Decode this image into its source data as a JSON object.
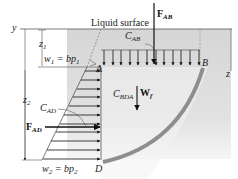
{
  "diagram": {
    "labels": {
      "liquid_surface": "Liquid surface",
      "y_axis": "y",
      "z_axis": "z",
      "z1": "z",
      "z1_sub": "1",
      "z2": "z",
      "z2_sub": "2",
      "w1_lhs": "w",
      "w1_sub": "1",
      "w1_rhs": " = bp",
      "w1_rhs_sub": "1",
      "w2_lhs": "w",
      "w2_sub": "2",
      "w2_rhs": " = bp",
      "w2_rhs_sub": "2",
      "point_A": "A",
      "point_B": "B",
      "point_D": "D",
      "F_AB": "F",
      "F_AB_sub": "AB",
      "C_AB": "C",
      "C_AB_sub": "AB",
      "W_f": "W",
      "W_f_sub": "f",
      "C_BDA": "C",
      "C_BDA_sub": "BDA",
      "C_AD": "C",
      "C_AD_sub": "AD",
      "F_AD": "F",
      "F_AD_sub": "AD"
    },
    "colors": {
      "fluid_shade": "#d8d8d8",
      "curved_surface": "#8e8e8e",
      "arrows": "#111111",
      "background": "#ffffff"
    }
  }
}
